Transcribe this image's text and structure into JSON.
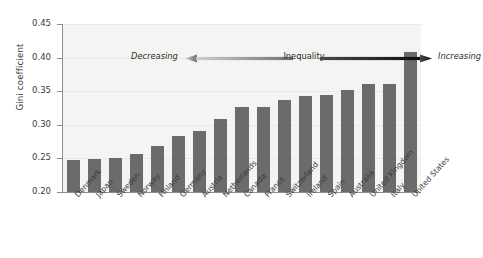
{
  "chart_data": {
    "type": "bar",
    "title": "",
    "xlabel": "",
    "ylabel": "Gini coefficient",
    "ylim": [
      0.2,
      0.45
    ],
    "yticks": [
      0.2,
      0.25,
      0.3,
      0.35,
      0.4,
      0.45
    ],
    "ytick_labels": [
      "0.20",
      "0.25",
      "0.30",
      "0.35",
      "0.40",
      "0.45"
    ],
    "grid": true,
    "legend": null,
    "bar_color": "#6b6b6b",
    "plot_background": "#f4f4f2",
    "categories": [
      "Denmark",
      "Japan",
      "Sweden",
      "Norway",
      "Finland",
      "Germany",
      "Austria",
      "Netherlands",
      "Canada",
      "France",
      "Switzerland",
      "Ireland",
      "Spain",
      "Australia",
      "United Kingdom",
      "Italy",
      "United States"
    ],
    "values": [
      0.247,
      0.249,
      0.25,
      0.257,
      0.269,
      0.283,
      0.291,
      0.309,
      0.326,
      0.327,
      0.337,
      0.343,
      0.345,
      0.352,
      0.36,
      0.36,
      0.408
    ],
    "annotations": {
      "left_label": "Decreasing",
      "center_label": "Inequality",
      "right_label": "Increasing",
      "left_arrow_direction": "left",
      "right_arrow_direction": "right"
    }
  }
}
